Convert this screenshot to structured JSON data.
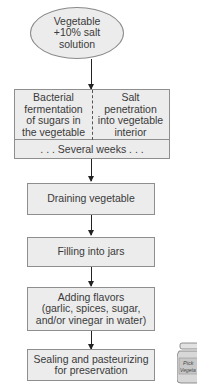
{
  "diagram": {
    "type": "flowchart",
    "start_node": {
      "shape": "ellipse",
      "lines": [
        "Vegetable",
        "+10% salt",
        "solution"
      ]
    },
    "parallel_step": {
      "left": {
        "lines": [
          "Bacterial",
          "fermentation",
          "of sugars in",
          "the vegetable"
        ]
      },
      "right": {
        "lines": [
          "Salt",
          "penetration",
          "into vegetable",
          "interior"
        ]
      },
      "duration": ". . . Several weeks . . ."
    },
    "steps": [
      {
        "lines": [
          "Draining vegetable"
        ]
      },
      {
        "lines": [
          "Filling into jars"
        ]
      },
      {
        "lines": [
          "Adding flavors",
          "(garlic, spices, sugar,",
          "and/or vinegar in water)"
        ]
      },
      {
        "lines": [
          "Sealing and pasteurizing",
          "for preservation"
        ]
      }
    ],
    "illustration": {
      "name": "pickled-vegetables-jar",
      "label_partial": [
        "Pick",
        "Vegeta"
      ]
    },
    "colors": {
      "fill": "#ececec",
      "border": "#8e8e8e",
      "arrow": "#222222",
      "text": "#3a3a3a"
    }
  }
}
